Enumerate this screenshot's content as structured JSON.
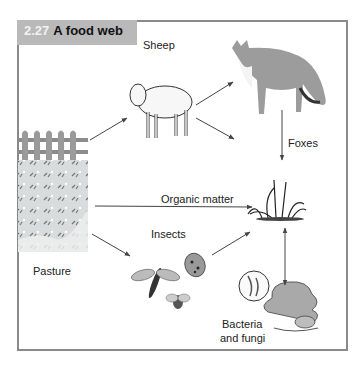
{
  "figure": {
    "number": "2.27",
    "title": "A food web"
  },
  "nodes": {
    "pasture": {
      "label": "Pasture",
      "icon": "pasture-fence-icon"
    },
    "sheep": {
      "label": "Sheep",
      "icon": "sheep-icon"
    },
    "foxes": {
      "label": "Foxes",
      "icon": "fox-icon"
    },
    "organic_matter": {
      "label": "Organic matter",
      "icon": "plant-icon"
    },
    "insects": {
      "label": "Insects",
      "icon": "insects-icon"
    },
    "decomposers": {
      "label_line1": "Bacteria",
      "label_line2": "and fungi",
      "icon": "fungi-icon"
    }
  },
  "edges": [
    {
      "from": "Pasture",
      "to": "Sheep"
    },
    {
      "from": "Pasture",
      "to": "Organic matter"
    },
    {
      "from": "Pasture",
      "to": "Insects"
    },
    {
      "from": "Sheep",
      "to": "Foxes"
    },
    {
      "from": "Sheep",
      "to": "Organic matter"
    },
    {
      "from": "Foxes",
      "to": "Organic matter"
    },
    {
      "from": "Insects",
      "to": "Organic matter"
    },
    {
      "from": "Organic matter",
      "to": "Bacteria and fungi",
      "bidirectional": true
    }
  ],
  "colors": {
    "frame": "#8a8a8a",
    "title_bg": "#b9b9b9",
    "arrow": "#444444"
  }
}
